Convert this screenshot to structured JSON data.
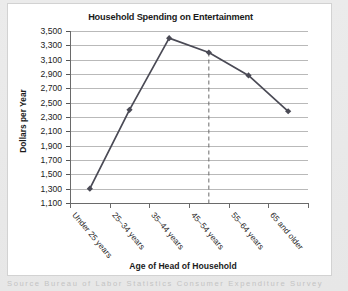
{
  "chart_data": {
    "type": "line",
    "title": "Household Spending on Entertainment",
    "xlabel": "Age of Head of Household",
    "ylabel": "Dollars per Year",
    "categories": [
      "Under 25 years",
      "25–34 years",
      "35–44 years",
      "45–54 years",
      "55–64 years",
      "65 and older"
    ],
    "values": [
      1300,
      2400,
      3400,
      3200,
      2880,
      2380
    ],
    "ylim": [
      1100,
      3500
    ],
    "ytick_labels": [
      "3,500",
      "3,300",
      "3,100",
      "2,900",
      "2,700",
      "2,500",
      "2,300",
      "2,100",
      "1,900",
      "1,700",
      "1,500",
      "1,300",
      "1,100"
    ],
    "ytick_values": [
      3500,
      3300,
      3100,
      2900,
      2700,
      2500,
      2300,
      2100,
      1900,
      1700,
      1500,
      1300,
      1100
    ],
    "ytick_step": 200,
    "grid": true,
    "legend": "none",
    "series_color": "#4a4a55",
    "marker": "diamond",
    "annotations": [
      {
        "type": "vertical-dashed-reference-line",
        "at_category": "45–54 years",
        "value": 3200,
        "color": "#6b6b6b"
      }
    ]
  },
  "figure": {
    "background_color": "#e9e9e9",
    "card_color": "#ffffff",
    "caption_partial": "Source  Bureau  of  Labor  Statistics  Consumer  Expenditure  Survey"
  }
}
